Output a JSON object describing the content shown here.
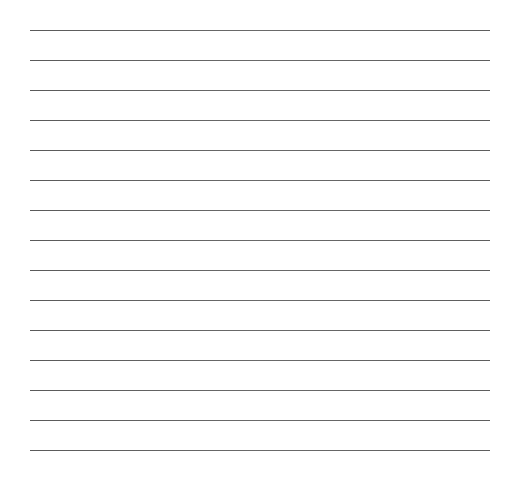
{
  "page": {
    "type": "lined-paper",
    "background_color": "#ffffff",
    "line_color": "#5e5e5e",
    "line_count": 15,
    "line_start_y": 30,
    "line_spacing": 30,
    "line_left_x": 30,
    "line_right_x": 490,
    "lines": [
      {
        "y": 30,
        "text": ""
      },
      {
        "y": 60,
        "text": ""
      },
      {
        "y": 90,
        "text": ""
      },
      {
        "y": 120,
        "text": ""
      },
      {
        "y": 150,
        "text": ""
      },
      {
        "y": 180,
        "text": ""
      },
      {
        "y": 210,
        "text": ""
      },
      {
        "y": 240,
        "text": ""
      },
      {
        "y": 270,
        "text": ""
      },
      {
        "y": 300,
        "text": ""
      },
      {
        "y": 330,
        "text": ""
      },
      {
        "y": 360,
        "text": ""
      },
      {
        "y": 390,
        "text": ""
      },
      {
        "y": 420,
        "text": ""
      },
      {
        "y": 450,
        "text": ""
      }
    ]
  }
}
